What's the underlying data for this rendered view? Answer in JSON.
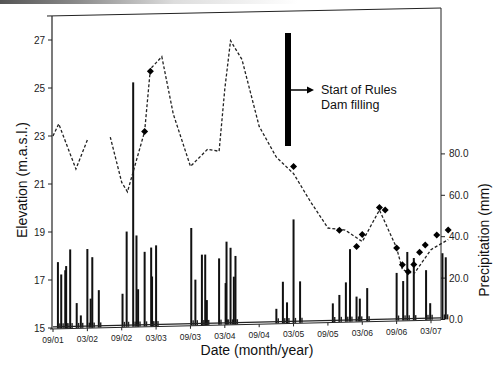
{
  "chart_data": {
    "type": "line+bar",
    "title": "",
    "xlabel": "Date (month/year)",
    "ylabel_left": "Elevation (m.a.s.l.)",
    "ylabel_right": "Precipitation (mm)",
    "x_ticks": [
      "09/01",
      "03/02",
      "09/02",
      "03/03",
      "09/03",
      "03/04",
      "09/04",
      "03/05",
      "09/05",
      "03/06",
      "09/06",
      "03/07"
    ],
    "y_left_ticks": [
      "15",
      "17",
      "19",
      "21",
      "23",
      "25",
      "27"
    ],
    "y_left_range": [
      15,
      28
    ],
    "y_right_ticks": [
      "0.0",
      "20.0",
      "40.0",
      "60.0",
      "80.0"
    ],
    "y_right_range": [
      0,
      140
    ],
    "grid": false,
    "annotation": {
      "line1": "Start of Rules",
      "line2": "Dam filling",
      "approx_date": "06/04"
    },
    "series": [
      {
        "name": "Reservoir elevation (dashed line)",
        "axis": "left",
        "style": "dashed",
        "points": [
          {
            "date": "09/01",
            "value": 23.0
          },
          {
            "date": "10/01",
            "value": 23.5
          },
          {
            "date": "01/02",
            "value": 21.6
          },
          {
            "date": "03/02",
            "value": 22.8
          },
          {
            "date": "07/02",
            "value": 22.9
          },
          {
            "date": "09/02",
            "value": 21.0
          },
          {
            "date": "10/02",
            "value": 20.6
          },
          {
            "date": "01/03",
            "value": 23.1
          },
          {
            "date": "02/03",
            "value": 25.7
          },
          {
            "date": "04/03",
            "value": 26.2
          },
          {
            "date": "06/03",
            "value": 23.8
          },
          {
            "date": "09/03",
            "value": 21.6
          },
          {
            "date": "12/03",
            "value": 22.3
          },
          {
            "date": "02/04",
            "value": 22.2
          },
          {
            "date": "03/04",
            "value": 24.8
          },
          {
            "date": "04/04",
            "value": 26.8
          },
          {
            "date": "06/04",
            "value": 26.0
          },
          {
            "date": "09/04",
            "value": 23.2
          },
          {
            "date": "12/04",
            "value": 21.9
          },
          {
            "date": "03/05",
            "value": 21.2
          },
          {
            "date": "06/05",
            "value": 20.0
          },
          {
            "date": "09/05",
            "value": 18.9
          },
          {
            "date": "12/05",
            "value": 18.8
          },
          {
            "date": "03/06",
            "value": 18.3
          },
          {
            "date": "06/06",
            "value": 19.6
          },
          {
            "date": "09/06",
            "value": 18.0
          },
          {
            "date": "10/06",
            "value": 17.1
          },
          {
            "date": "12/06",
            "value": 16.9
          },
          {
            "date": "03/07",
            "value": 17.9
          },
          {
            "date": "06/07",
            "value": 18.3
          }
        ]
      },
      {
        "name": "Measured elevation (diamond markers)",
        "axis": "left",
        "style": "marker",
        "points": [
          {
            "date": "01/03",
            "value": 23.1
          },
          {
            "date": "02/03",
            "value": 25.6
          },
          {
            "date": "03/05",
            "value": 21.5
          },
          {
            "date": "11/05",
            "value": 18.8
          },
          {
            "date": "02/06",
            "value": 18.1
          },
          {
            "date": "03/06",
            "value": 18.6
          },
          {
            "date": "06/06",
            "value": 19.7
          },
          {
            "date": "07/06",
            "value": 19.6
          },
          {
            "date": "09/06",
            "value": 18.0
          },
          {
            "date": "10/06",
            "value": 17.3
          },
          {
            "date": "11/06",
            "value": 17.0
          },
          {
            "date": "12/06",
            "value": 17.3
          },
          {
            "date": "01/07",
            "value": 17.8
          },
          {
            "date": "02/07",
            "value": 18.1
          },
          {
            "date": "04/07",
            "value": 18.5
          },
          {
            "date": "06/07",
            "value": 18.7
          }
        ]
      },
      {
        "name": "Precipitation (bars)",
        "axis": "right",
        "style": "bar",
        "note": "Values in mm, estimated from bar heights against right axis",
        "points": [
          {
            "date": "10/01",
            "value": 32
          },
          {
            "date": "10/01b",
            "value": 26
          },
          {
            "date": "11/01",
            "value": 28
          },
          {
            "date": "11/01b",
            "value": 30
          },
          {
            "date": "12/01",
            "value": 38
          },
          {
            "date": "01/02",
            "value": 12
          },
          {
            "date": "02/02",
            "value": 6
          },
          {
            "date": "03/02",
            "value": 38
          },
          {
            "date": "03/02b",
            "value": 14
          },
          {
            "date": "04/02",
            "value": 34
          },
          {
            "date": "05/02",
            "value": 18
          },
          {
            "date": "09/02",
            "value": 16
          },
          {
            "date": "10/02",
            "value": 46
          },
          {
            "date": "11/02",
            "value": 118
          },
          {
            "date": "11/02b",
            "value": 44
          },
          {
            "date": "12/02",
            "value": 18
          },
          {
            "date": "01/03",
            "value": 36
          },
          {
            "date": "02/03",
            "value": 38
          },
          {
            "date": "02/03b",
            "value": 24
          },
          {
            "date": "03/03",
            "value": 39
          },
          {
            "date": "09/03",
            "value": 47
          },
          {
            "date": "10/03",
            "value": 22
          },
          {
            "date": "11/03",
            "value": 34
          },
          {
            "date": "11/03b",
            "value": 34
          },
          {
            "date": "12/03",
            "value": 12
          },
          {
            "date": "02/04",
            "value": 32
          },
          {
            "date": "03/04",
            "value": 20
          },
          {
            "date": "03/04b",
            "value": 40
          },
          {
            "date": "04/04",
            "value": 37
          },
          {
            "date": "04/04b",
            "value": 23
          },
          {
            "date": "05/04",
            "value": 33
          },
          {
            "date": "12/04",
            "value": 7
          },
          {
            "date": "01/05",
            "value": 20
          },
          {
            "date": "02/05",
            "value": 10
          },
          {
            "date": "03/05",
            "value": 50
          },
          {
            "date": "04/05",
            "value": 20
          },
          {
            "date": "10/05",
            "value": 9
          },
          {
            "date": "11/05",
            "value": 13
          },
          {
            "date": "12/05",
            "value": 19
          },
          {
            "date": "01/06",
            "value": 35
          },
          {
            "date": "02/06",
            "value": 12
          },
          {
            "date": "02/06b",
            "value": 11
          },
          {
            "date": "04/06",
            "value": 16
          },
          {
            "date": "09/06",
            "value": 23
          },
          {
            "date": "10/06",
            "value": 19
          },
          {
            "date": "11/06",
            "value": 33
          },
          {
            "date": "12/06",
            "value": 30
          },
          {
            "date": "02/07",
            "value": 24
          },
          {
            "date": "03/07",
            "value": 8
          },
          {
            "date": "05/07",
            "value": 32
          },
          {
            "date": "05/07b",
            "value": 30
          }
        ]
      }
    ]
  },
  "axes": {
    "x_title": "Date (month/year)",
    "y_left_title": "Elevation (m.a.s.l.)",
    "y_right_title": "Precipitation (mm)"
  }
}
